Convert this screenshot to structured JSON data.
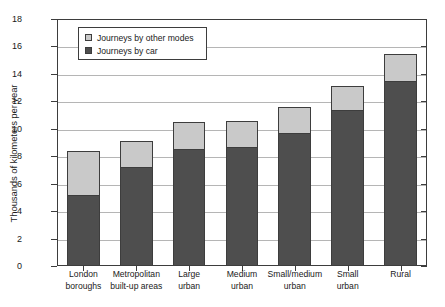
{
  "chart_data": {
    "type": "bar",
    "subtype": "stacked-bar",
    "title": "",
    "xlabel": "",
    "ylabel": "Thousands of kilometers per year",
    "ylim": [
      0,
      18
    ],
    "ytick_step": 2,
    "yticks": [
      "0",
      "2",
      "4",
      "6",
      "8",
      "10",
      "12",
      "14",
      "16",
      "18"
    ],
    "grid": true,
    "grid_axis": "y",
    "legend_position": "upper-left-inside",
    "categories": [
      "London boroughs",
      "Metropolitan built-up areas",
      "Large urban",
      "Medium urban",
      "Small/medium urban",
      "Small urban",
      "Rural"
    ],
    "category_lines": [
      [
        "London",
        "boroughs"
      ],
      [
        "Metropolitan",
        "built-up areas"
      ],
      [
        "Large",
        "urban"
      ],
      [
        "Medium",
        "urban"
      ],
      [
        "Small/medium",
        "urban"
      ],
      [
        "Small",
        "urban"
      ],
      [
        "Rural"
      ]
    ],
    "series": [
      {
        "name": "Journeys by car",
        "color": "#4e4e4e",
        "values": [
          5.2,
          7.2,
          8.5,
          8.65,
          9.7,
          11.35,
          13.5
        ]
      },
      {
        "name": "Journeys by other modes",
        "color": "#c9c9c9",
        "values": [
          3.2,
          1.9,
          2.0,
          1.95,
          1.9,
          1.75,
          1.95
        ]
      }
    ],
    "totals": [
      8.4,
      9.1,
      10.5,
      10.6,
      11.6,
      13.1,
      15.45
    ],
    "stack_order": [
      "Journeys by car",
      "Journeys by other modes"
    ]
  },
  "legend": {
    "items": [
      {
        "label": "Journeys by other modes",
        "swatch": "light-gray"
      },
      {
        "label": "Journeys by car",
        "swatch": "dark-gray"
      }
    ]
  },
  "colors": {
    "car": "#4e4e4e",
    "other_modes": "#c9c9c9",
    "axis": "#3d3d3d",
    "grid": "#b5b5b5",
    "background": "#ffffff",
    "text": "#1a1a1a"
  }
}
